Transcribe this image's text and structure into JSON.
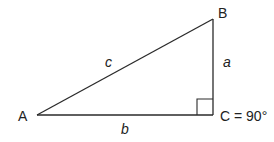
{
  "diagram": {
    "type": "right-triangle",
    "vertices": {
      "A": {
        "label": "A",
        "x": 37,
        "y": 115
      },
      "B": {
        "label": "B",
        "x": 213,
        "y": 19
      },
      "C": {
        "label": "C = 90°",
        "x": 213,
        "y": 115
      }
    },
    "sides": {
      "a": {
        "label": "a",
        "from": "B",
        "to": "C"
      },
      "b": {
        "label": "b",
        "from": "A",
        "to": "C"
      },
      "c": {
        "label": "c",
        "from": "A",
        "to": "B"
      }
    },
    "right_angle_at": "C",
    "colors": {
      "stroke": "#2a2a2a",
      "text": "#222222",
      "background": "#ffffff"
    }
  }
}
